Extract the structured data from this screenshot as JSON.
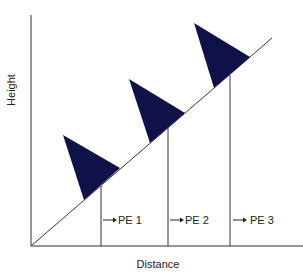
{
  "diagram": {
    "x_axis_label": "Distance",
    "y_axis_label": "Height",
    "colors": {
      "triangle": "#0f1248",
      "line": "#333333",
      "text": "#222222"
    },
    "labels": [
      {
        "text": "PE 1"
      },
      {
        "text": "PE 2"
      },
      {
        "text": "PE 3"
      }
    ],
    "markers": [
      {
        "name": "marker-1"
      },
      {
        "name": "marker-2"
      },
      {
        "name": "marker-3"
      }
    ]
  }
}
